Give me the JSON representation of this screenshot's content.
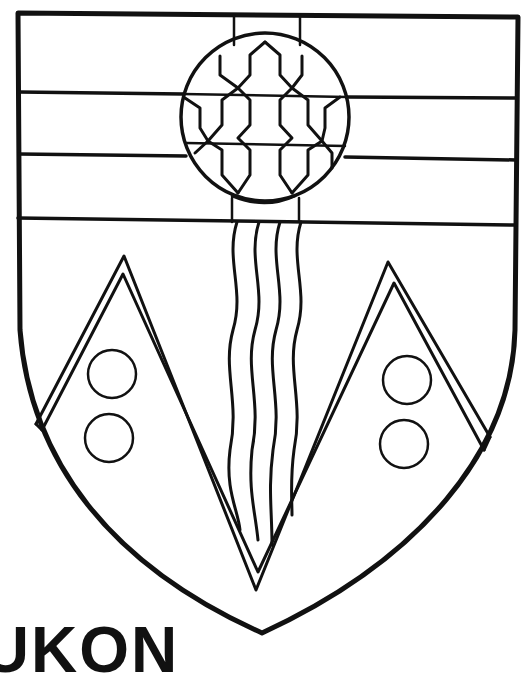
{
  "caption_text": "YUKON",
  "colors": {
    "ink": "#111111",
    "background": "#ffffff"
  },
  "elements": {
    "shield": "shield-outline",
    "chief_bands": 3,
    "roundel": "roundel-with-fretty-pattern",
    "pale": "vertical-pale",
    "wavy_lines": 4,
    "peaks": [
      "left-mountain",
      "right-mountain"
    ],
    "bezants_per_peak": 2
  }
}
